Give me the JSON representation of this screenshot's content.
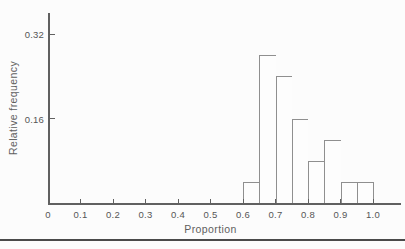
{
  "page": {
    "background": "#fcfcfc",
    "rule_color": "#4a4a4a"
  },
  "chart_data": {
    "type": "bar",
    "subtype": "histogram",
    "title": "",
    "xlabel": "Proportion",
    "ylabel": "Relative frequency",
    "bin_edges": [
      0.6,
      0.65,
      0.7,
      0.75,
      0.8,
      0.85,
      0.9,
      0.95,
      1.0
    ],
    "values": [
      0.04,
      0.28,
      0.24,
      0.16,
      0.08,
      0.12,
      0.04,
      0.04
    ],
    "bins": [
      {
        "range": [
          0.6,
          0.65
        ],
        "value": 0.04
      },
      {
        "range": [
          0.65,
          0.7
        ],
        "value": 0.28
      },
      {
        "range": [
          0.7,
          0.75
        ],
        "value": 0.24
      },
      {
        "range": [
          0.75,
          0.8
        ],
        "value": 0.16
      },
      {
        "range": [
          0.8,
          0.85
        ],
        "value": 0.08
      },
      {
        "range": [
          0.85,
          0.9
        ],
        "value": 0.12
      },
      {
        "range": [
          0.9,
          0.95
        ],
        "value": 0.04
      },
      {
        "range": [
          0.95,
          1.0
        ],
        "value": 0.04
      }
    ],
    "x_ticks": {
      "values": [
        0,
        0.1,
        0.2,
        0.3,
        0.4,
        0.5,
        0.6,
        0.7,
        0.8,
        0.9,
        1.0
      ],
      "labels": [
        "0",
        "0.1",
        "0.2",
        "0.3",
        "0.4",
        "0.5",
        "0.6",
        "0.7",
        "0.8",
        "0.9",
        "1.0"
      ]
    },
    "y_ticks": {
      "values": [
        0.16,
        0.32
      ],
      "labels": [
        "0.16",
        "0.32"
      ]
    },
    "xlim": [
      0,
      1.09
    ],
    "ylim": [
      0,
      0.36
    ],
    "grid": false,
    "legend": null,
    "colors": {
      "bar_fill": "#fdfdfd",
      "bar_stroke": "#8f8f8f",
      "axis": "#606060",
      "text": "#565656"
    }
  }
}
